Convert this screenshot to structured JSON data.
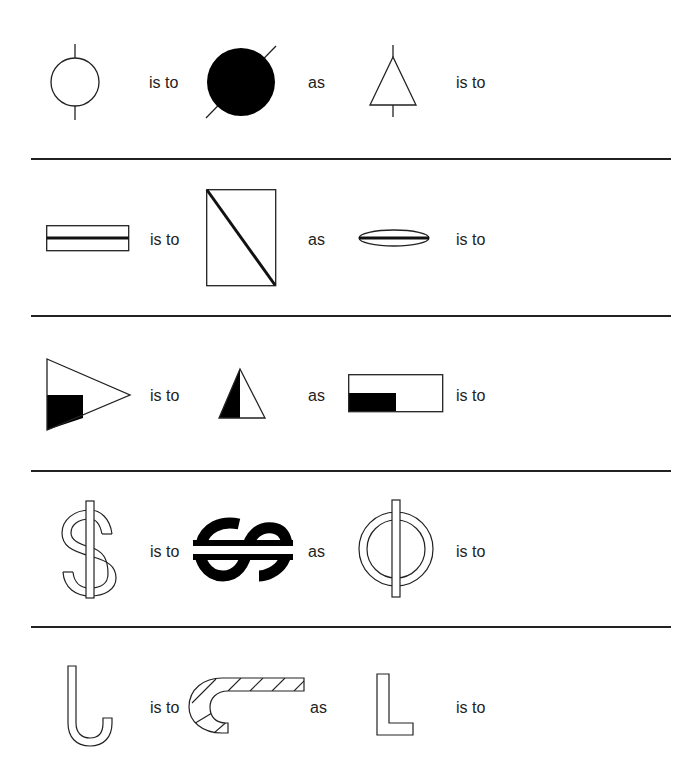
{
  "puzzle": {
    "rows": [
      {
        "id": "row-1",
        "figures": [
          "circle-with-vertical-ticks",
          "filled-circle-with-diagonal-line",
          "triangle-with-vertical-ticks"
        ],
        "labels": {
          "is_to_1": "is to",
          "as": "as",
          "is_to_2": "is to"
        }
      },
      {
        "id": "row-2",
        "figures": [
          "wide-rectangle-with-horizontal-line",
          "tall-rectangle-with-diagonal-line",
          "ellipse-with-horizontal-line"
        ],
        "labels": {
          "is_to_1": "is to",
          "as": "as",
          "is_to_2": "is to"
        }
      },
      {
        "id": "row-3",
        "figures": [
          "right-pointing-triangle-with-shaded-corner",
          "half-shaded-triangle",
          "rectangle-with-shaded-corner"
        ],
        "labels": {
          "is_to_1": "is to",
          "as": "as",
          "is_to_2": "is to"
        }
      },
      {
        "id": "row-4",
        "figures": [
          "outlined-dollar-sign",
          "rotated-bold-dollar-sign",
          "outlined-circle-with-bar"
        ],
        "labels": {
          "is_to_1": "is to",
          "as": "as",
          "is_to_2": "is to"
        }
      },
      {
        "id": "row-5",
        "figures": [
          "outlined-j-hook",
          "hatched-rotated-hook",
          "outlined-letter-l"
        ],
        "labels": {
          "is_to_1": "is to",
          "as": "as",
          "is_to_2": "is to"
        }
      }
    ],
    "colors": {
      "stroke": "#222222",
      "fill": "#000000",
      "background": "#ffffff"
    }
  }
}
